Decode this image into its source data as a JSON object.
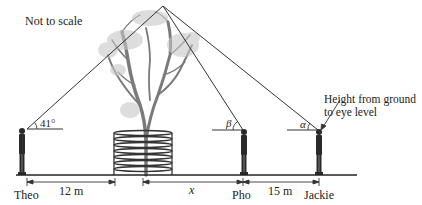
{
  "diagram": {
    "note": "Not to scale",
    "people": [
      {
        "name": "Theo",
        "angle_label": "41°"
      },
      {
        "name": "Pho",
        "angle_label": "β"
      },
      {
        "name": "Jackie",
        "angle_label": "α"
      }
    ],
    "dimensions": [
      {
        "label": "12 m",
        "from": "Theo",
        "to": "planter"
      },
      {
        "label": "x",
        "from": "tree",
        "to": "Pho"
      },
      {
        "label": "15 m",
        "from": "Pho",
        "to": "Jackie"
      }
    ],
    "callout": "Height from ground to eye level",
    "colors": {
      "line": "#333333",
      "tree": "#7a7a7a",
      "figure": "#2a2a2a"
    }
  }
}
